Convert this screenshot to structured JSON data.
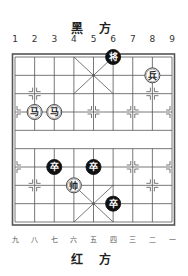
{
  "header": {
    "title": "黑 方"
  },
  "footer": {
    "title": "红 方"
  },
  "top_coords": [
    "1",
    "2",
    "3",
    "4",
    "5",
    "6",
    "7",
    "8",
    "9"
  ],
  "bottom_coords": [
    "九",
    "八",
    "七",
    "六",
    "五",
    "四",
    "三",
    "二",
    "一"
  ],
  "colors": {
    "board_line": "#555555",
    "black_piece_fill": "#111111",
    "black_piece_text": "#ffffff",
    "red_piece_fill": "#ffffff",
    "red_piece_stroke": "#333333",
    "red_piece_text": "#222222"
  },
  "board": {
    "files": 9,
    "ranks": 10,
    "river_between_ranks": [
      4,
      5
    ]
  },
  "pieces": [
    {
      "side": "black",
      "char": "将",
      "name": "black-general",
      "file": 6,
      "rank": 0
    },
    {
      "side": "red",
      "char": "兵",
      "name": "red-soldier",
      "file": 8,
      "rank": 1
    },
    {
      "side": "red",
      "char": "马",
      "name": "red-horse",
      "file": 2,
      "rank": 3
    },
    {
      "side": "red",
      "char": "马",
      "name": "red-horse",
      "file": 3,
      "rank": 3
    },
    {
      "side": "black",
      "char": "卒",
      "name": "black-soldier",
      "file": 3,
      "rank": 6
    },
    {
      "side": "black",
      "char": "卒",
      "name": "black-soldier",
      "file": 5,
      "rank": 6
    },
    {
      "side": "red",
      "char": "帅",
      "name": "red-general",
      "file": 4,
      "rank": 7
    },
    {
      "side": "black",
      "char": "卒",
      "name": "black-soldier",
      "file": 6,
      "rank": 8
    }
  ]
}
